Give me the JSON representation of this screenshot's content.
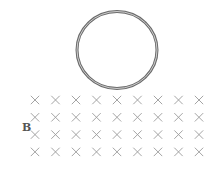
{
  "diagram": {
    "ring": {
      "cx": 117,
      "cy": 50,
      "rx": 40,
      "ry": 38.5,
      "stroke_color": "#6b6b6b",
      "style": "double-line"
    },
    "field": {
      "label": "B",
      "direction": "into-page",
      "symbol": "×",
      "rows": 4,
      "cols": 9,
      "x_start": 35,
      "x_step": 20.5,
      "y_start": 100,
      "y_step": 17.3,
      "color": "#9a9a9a"
    },
    "label_position": {
      "x": 22,
      "y": 131
    }
  }
}
